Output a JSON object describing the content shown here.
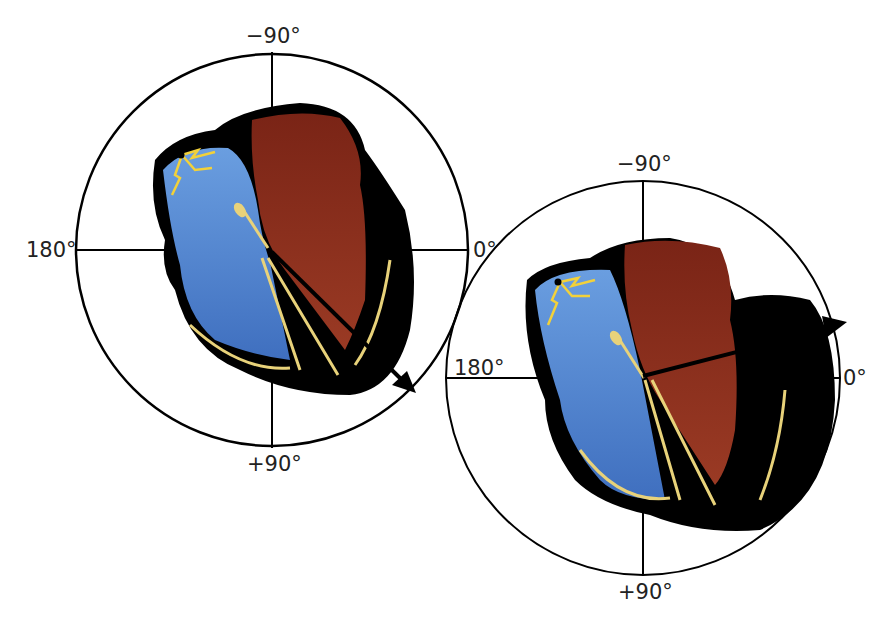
{
  "figure": {
    "colors": {
      "right_heart_blue": "#5b8fd6",
      "left_heart_red": "#8a2a1a",
      "conduction_yellow": "#e8d27a",
      "outline_black": "#000000"
    },
    "panels": [
      {
        "id": "normal",
        "labels": {
          "top": "−90°",
          "bottom": "+90°",
          "left": "180°",
          "right": "0°"
        },
        "axis_arrow": "points down-right toward about +40°"
      },
      {
        "id": "left-axis-deviation",
        "labels": {
          "top": "−90°",
          "bottom": "+90°",
          "left": "180°",
          "right": "0°"
        },
        "axis_arrow": "points up-right toward about −20° (enlarged left ventricle)"
      }
    ]
  }
}
